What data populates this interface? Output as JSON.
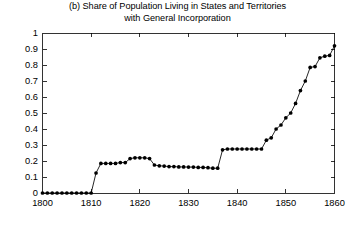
{
  "chart_data": {
    "type": "line",
    "title": "(b) Share of Population Living in States and Territories\nwith General Incorporation",
    "title_line_1": "(b) Share of Population Living in States and Territories",
    "title_line_2": "with General Incorporation",
    "xlabel": "",
    "ylabel": "",
    "xlim": [
      1800,
      1860
    ],
    "ylim": [
      0,
      1
    ],
    "xticks": [
      1800,
      1810,
      1820,
      1830,
      1840,
      1850,
      1860
    ],
    "xtick_labels": [
      "1800",
      "1810",
      "1820",
      "1830",
      "1840",
      "1850",
      "1860"
    ],
    "yticks": [
      0,
      0.1,
      0.2,
      0.3,
      0.4,
      0.5,
      0.6,
      0.7,
      0.8,
      0.9,
      1
    ],
    "ytick_labels": [
      "0",
      "0.1",
      "0.2",
      "0.3",
      "0.4",
      "0.5",
      "0.6",
      "0.7",
      "0.8",
      "0.9",
      "1"
    ],
    "grid": false,
    "legend": null,
    "marker": "filled-circle",
    "line_color": "#000000",
    "marker_color": "#000000",
    "x": [
      1800,
      1801,
      1802,
      1803,
      1804,
      1805,
      1806,
      1807,
      1808,
      1809,
      1810,
      1811,
      1812,
      1813,
      1814,
      1815,
      1816,
      1817,
      1818,
      1819,
      1820,
      1821,
      1822,
      1823,
      1824,
      1825,
      1826,
      1827,
      1828,
      1829,
      1830,
      1831,
      1832,
      1833,
      1834,
      1835,
      1836,
      1837,
      1838,
      1839,
      1840,
      1841,
      1842,
      1843,
      1844,
      1845,
      1846,
      1847,
      1848,
      1849,
      1850,
      1851,
      1852,
      1853,
      1854,
      1855,
      1856,
      1857,
      1858,
      1859,
      1860
    ],
    "values": [
      0,
      0,
      0,
      0,
      0,
      0,
      0,
      0,
      0,
      0,
      0,
      0.125,
      0.185,
      0.185,
      0.185,
      0.185,
      0.19,
      0.19,
      0.215,
      0.22,
      0.22,
      0.22,
      0.215,
      0.175,
      0.17,
      0.168,
      0.165,
      0.165,
      0.163,
      0.163,
      0.162,
      0.162,
      0.16,
      0.16,
      0.158,
      0.155,
      0.155,
      0.27,
      0.275,
      0.275,
      0.275,
      0.275,
      0.275,
      0.275,
      0.275,
      0.275,
      0.33,
      0.345,
      0.4,
      0.425,
      0.47,
      0.5,
      0.56,
      0.64,
      0.7,
      0.785,
      0.79,
      0.845,
      0.855,
      0.86,
      0.92
    ],
    "series_name": "share-of-population"
  }
}
